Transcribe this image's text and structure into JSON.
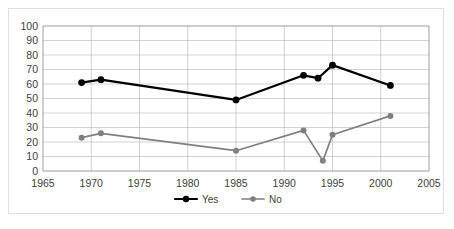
{
  "chart_data": {
    "type": "line",
    "title": "",
    "subtitle": "",
    "xlabel": "",
    "ylabel": "",
    "xlim": [
      1965,
      2005
    ],
    "ylim": [
      0,
      100
    ],
    "xticks": [
      1965,
      1970,
      1975,
      1980,
      1985,
      1990,
      1995,
      2000,
      2005
    ],
    "yticks": [
      0,
      10,
      20,
      30,
      40,
      50,
      60,
      70,
      80,
      90,
      100
    ],
    "xtick_labels": [
      "1965",
      "1970",
      "1975",
      "1980",
      "1985",
      "1990",
      "1995",
      "2000",
      "2005"
    ],
    "ytick_labels": [
      "0",
      "10",
      "20",
      "30",
      "40",
      "50",
      "60",
      "70",
      "80",
      "90",
      "100"
    ],
    "grid": true,
    "grid_axis": "both",
    "legend_position": "bottom",
    "series": [
      {
        "name": "Yes",
        "color": "#000000",
        "marker": "circle",
        "x": [
          1969,
          1971,
          1985,
          1992,
          1993.5,
          1995,
          2001
        ],
        "values": [
          61,
          63,
          49,
          66,
          64,
          73,
          59
        ]
      },
      {
        "name": "No",
        "color": "#808080",
        "marker": "circle",
        "x": [
          1969,
          1971,
          1985,
          1992,
          1994,
          1995,
          2001
        ],
        "values": [
          23,
          26,
          14,
          28,
          7,
          25,
          38
        ]
      }
    ]
  },
  "legend": {
    "items": [
      {
        "label": "Yes",
        "color": "#000000"
      },
      {
        "label": "No",
        "color": "#808080"
      }
    ]
  }
}
